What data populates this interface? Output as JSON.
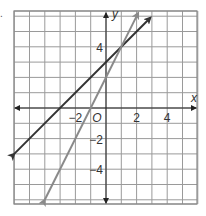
{
  "chart_data": {
    "type": "line",
    "title": "",
    "xlabel": "x",
    "ylabel": "y",
    "xlim": [
      -6,
      6
    ],
    "ylim": [
      -6,
      6.3
    ],
    "grid": true,
    "x_ticks": [
      {
        "value": -2,
        "label": "−2"
      },
      {
        "value": 2,
        "label": "2"
      },
      {
        "value": 4,
        "label": "4"
      }
    ],
    "y_ticks": [
      {
        "value": 4,
        "label": "4"
      },
      {
        "value": -2,
        "label": "−2"
      },
      {
        "value": -4,
        "label": "−4"
      }
    ],
    "origin_label": "O",
    "series": [
      {
        "name": "y = x + 3",
        "slope": 1,
        "intercept": 3,
        "color": "#333333",
        "x": [
          -6,
          2.9
        ],
        "y": [
          -3,
          5.9
        ]
      },
      {
        "name": "y = 2x + 2",
        "slope": 2,
        "intercept": 2,
        "color": "#8a8a8a",
        "x": [
          -4,
          2.1
        ],
        "y": [
          -6,
          6.2
        ]
      }
    ],
    "intersection": {
      "x": 1,
      "y": 4
    }
  },
  "bullet": "."
}
